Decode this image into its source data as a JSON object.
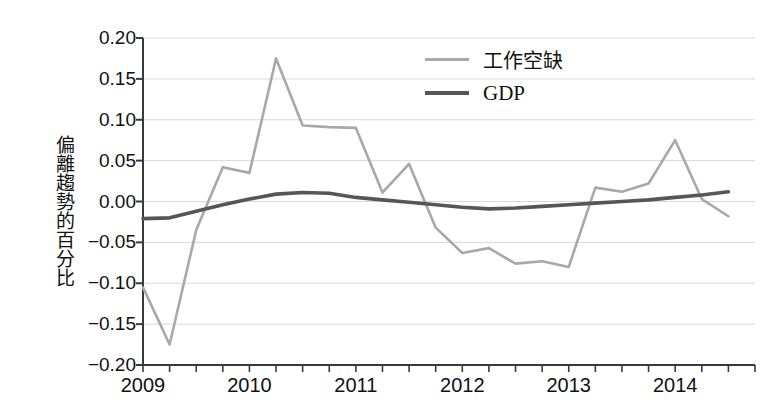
{
  "chart_data": {
    "type": "line",
    "title": "",
    "xlabel": "",
    "ylabel": "偏離趨勢的百分比",
    "xlim": [
      2009.0,
      2014.75
    ],
    "ylim": [
      -0.2,
      0.2
    ],
    "grid": true,
    "legend_position": "top-right",
    "x_tick_labels": [
      "2009",
      "2010",
      "2011",
      "2012",
      "2013",
      "2014"
    ],
    "x_tick_values": [
      2009,
      2010,
      2011,
      2012,
      2013,
      2014
    ],
    "x_minor_ticks_per_year": 4,
    "y_tick_labels": [
      "0.20",
      "0.15",
      "0.10",
      "0.05",
      "0.00",
      "-0.05",
      "-0.10",
      "-0.15",
      "-0.20"
    ],
    "y_tick_values": [
      0.2,
      0.15,
      0.1,
      0.05,
      0.0,
      -0.05,
      -0.1,
      -0.15,
      -0.2
    ],
    "x": [
      2009.0,
      2009.25,
      2009.5,
      2009.75,
      2010.0,
      2010.25,
      2010.5,
      2010.75,
      2011.0,
      2011.25,
      2011.5,
      2011.75,
      2012.0,
      2012.25,
      2012.5,
      2012.75,
      2013.0,
      2013.25,
      2013.5,
      2013.75,
      2014.0,
      2014.25,
      2014.5
    ],
    "series": [
      {
        "name": "工作空缺",
        "color": "#a8a8a8",
        "width": 2.6,
        "values": [
          -0.105,
          -0.175,
          -0.035,
          0.042,
          0.035,
          0.175,
          0.093,
          0.091,
          0.09,
          0.011,
          0.046,
          -0.032,
          -0.063,
          -0.057,
          -0.076,
          -0.073,
          -0.08,
          0.017,
          0.012,
          0.022,
          0.075,
          0.003,
          -0.018
        ]
      },
      {
        "name": "GDP",
        "color": "#565656",
        "width": 3.6,
        "values": [
          -0.021,
          -0.02,
          -0.012,
          -0.004,
          0.003,
          0.009,
          0.011,
          0.01,
          0.005,
          0.002,
          -0.001,
          -0.004,
          -0.007,
          -0.009,
          -0.008,
          -0.006,
          -0.004,
          -0.002,
          0.0,
          0.002,
          0.005,
          0.008,
          0.012
        ]
      }
    ]
  },
  "legend": {
    "items": [
      {
        "label": "工作空缺",
        "swatch": "vac"
      },
      {
        "label": "GDP",
        "swatch": "gdp"
      }
    ]
  }
}
